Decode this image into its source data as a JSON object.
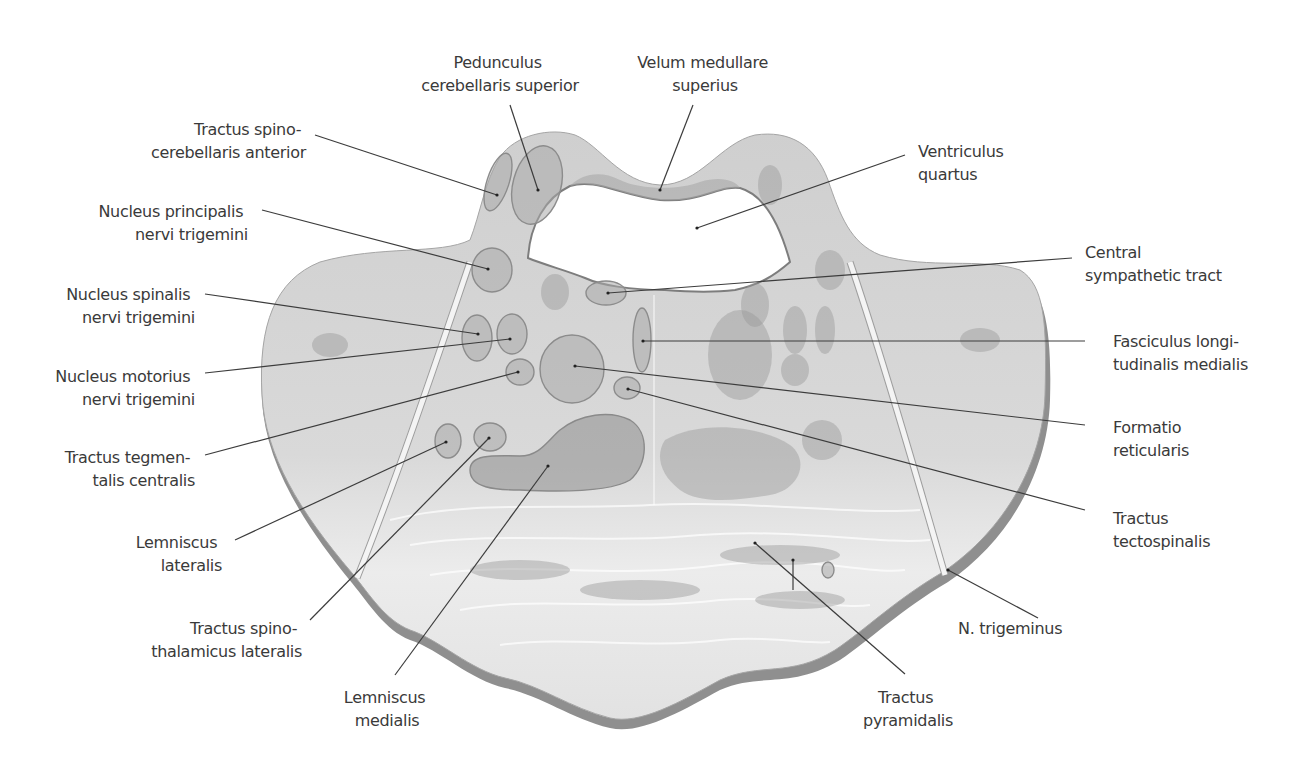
{
  "figure": {
    "colors": {
      "background": "#ffffff",
      "tissue": "#d6d6d6",
      "tissue_light": "#e6e6e6",
      "edge": "#8f8f8f",
      "structure": "#a9a9a9",
      "text": "#3a3a3a",
      "leader": "#3c3c3c"
    }
  },
  "labels": {
    "left": [
      {
        "id": "tractus-spinocerebellaris-anterior",
        "lines": [
          "Tractus spino-",
          "cerebellaris anterior"
        ]
      },
      {
        "id": "nucleus-principalis-nervi-trigemini",
        "lines": [
          "Nucleus principalis",
          "nervi trigemini"
        ]
      },
      {
        "id": "nucleus-spinalis-nervi-trigemini",
        "lines": [
          "Nucleus spinalis",
          "nervi trigemini"
        ]
      },
      {
        "id": "nucleus-motorius-nervi-trigemini",
        "lines": [
          "Nucleus motorius",
          "nervi trigemini"
        ]
      },
      {
        "id": "tractus-tegmentalis-centralis",
        "lines": [
          "Tractus tegmen-",
          "talis centralis"
        ]
      },
      {
        "id": "lemniscus-lateralis",
        "lines": [
          "Lemniscus",
          "lateralis"
        ]
      },
      {
        "id": "tractus-spinothalamicus-lateralis",
        "lines": [
          "Tractus spino-",
          "thalamicus lateralis"
        ]
      },
      {
        "id": "lemniscus-medialis",
        "lines": [
          "Lemniscus",
          "medialis"
        ]
      }
    ],
    "top": [
      {
        "id": "pedunculus-cerebellaris-superior",
        "lines": [
          "Pedunculus",
          "cerebellaris superior"
        ]
      },
      {
        "id": "velum-medullare-superius",
        "lines": [
          "Velum medullare",
          "superius"
        ]
      }
    ],
    "right": [
      {
        "id": "ventriculus-quartus",
        "lines": [
          "Ventriculus",
          "quartus"
        ]
      },
      {
        "id": "central-sympathetic-tract",
        "lines": [
          "Central",
          "sympathetic tract"
        ]
      },
      {
        "id": "fasciculus-longitudinalis-medialis",
        "lines": [
          "Fasciculus longi-",
          "tudinalis medialis"
        ]
      },
      {
        "id": "formatio-reticularis",
        "lines": [
          "Formatio",
          "reticularis"
        ]
      },
      {
        "id": "tractus-tectospinalis",
        "lines": [
          "Tractus",
          "tectospinalis"
        ]
      },
      {
        "id": "n-trigeminus",
        "lines": [
          "N. trigeminus"
        ]
      },
      {
        "id": "tractus-pyramidalis",
        "lines": [
          "Tractus",
          "pyramidalis"
        ]
      }
    ]
  }
}
